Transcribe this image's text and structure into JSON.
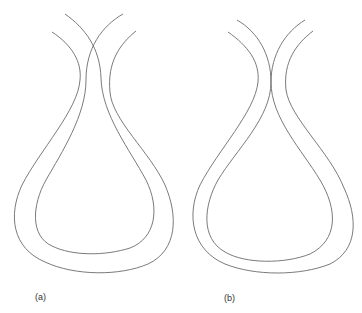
{
  "figure": {
    "panels": [
      {
        "id": "a",
        "label": "(a)",
        "description": "Two nested loop-shaped bands whose upper strands cross each other"
      },
      {
        "id": "b",
        "label": "(b)",
        "description": "Two nested loop-shaped bands whose upper strands touch at a single point"
      }
    ],
    "stroke_color": "#6b6b6b",
    "background": "#ffffff"
  }
}
